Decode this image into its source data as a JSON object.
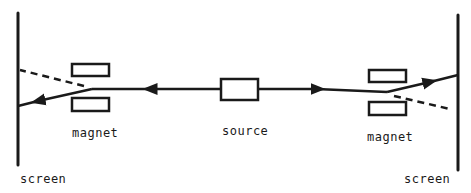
{
  "diagram": {
    "type": "schematic",
    "colors": {
      "ink": "#1a1a1a",
      "background": "#ffffff"
    },
    "labels": {
      "magnet_left": "magnet",
      "source": "source",
      "magnet_right": "magnet",
      "screen_left": "screen",
      "screen_right": "screen"
    },
    "elements": [
      {
        "id": "screen-left",
        "kind": "screen"
      },
      {
        "id": "magnet-left-top",
        "kind": "magnet"
      },
      {
        "id": "magnet-left-bottom",
        "kind": "magnet"
      },
      {
        "id": "source",
        "kind": "source"
      },
      {
        "id": "magnet-right-top",
        "kind": "magnet"
      },
      {
        "id": "magnet-right-bottom",
        "kind": "magnet"
      },
      {
        "id": "screen-right",
        "kind": "screen"
      }
    ],
    "paths": [
      {
        "from": "source",
        "to": "screen-left",
        "style": "solid",
        "deflection": "down"
      },
      {
        "from": "source",
        "to": "screen-left",
        "style": "dashed",
        "deflection": "up"
      },
      {
        "from": "source",
        "to": "screen-right",
        "style": "solid",
        "deflection": "up"
      },
      {
        "from": "source",
        "to": "screen-right",
        "style": "dashed",
        "deflection": "down"
      }
    ]
  }
}
